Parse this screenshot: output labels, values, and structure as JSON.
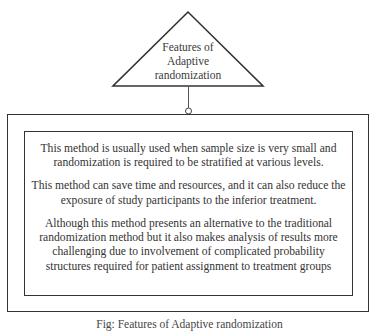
{
  "diagram": {
    "title_lines": [
      "Features of",
      "Adaptive",
      "randomization"
    ],
    "features": [
      "This method is usually used when sample size is very small and randomization is required to be stratified at various levels.",
      "This method can save time and resources, and it can also reduce the exposure of study participants to the inferior treatment.",
      "Although this method presents an alternative to the traditional randomization method but it also makes analysis of results more challenging due to involvement of complicated probability structures required for patient assignment to treatment groups"
    ],
    "caption": "Fig: Features of Adaptive randomization",
    "colors": {
      "stroke": "#333333",
      "text": "#333333",
      "background": "#ffffff"
    }
  }
}
